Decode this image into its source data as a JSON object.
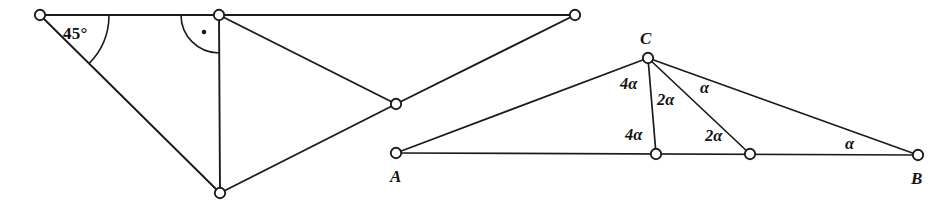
{
  "figure": {
    "canvas": {
      "width": 939,
      "height": 203,
      "background": "#ffffff"
    },
    "stroke_color": "#1b1b1b",
    "node_fill": "#ffffff"
  },
  "left_figure": {
    "name": "right-angle-construction",
    "vertices": [
      {
        "id": "L1",
        "name": "top-left-vertex",
        "x": 40,
        "y": 15
      },
      {
        "id": "L2",
        "name": "top-middle-vertex",
        "x": 219,
        "y": 15
      },
      {
        "id": "L3",
        "name": "top-right-vertex",
        "x": 575,
        "y": 15
      },
      {
        "id": "L4",
        "name": "crossing-vertex",
        "x": 396,
        "y": 104
      },
      {
        "id": "L5",
        "name": "bottom-vertex",
        "x": 220,
        "y": 193
      }
    ],
    "edges": [
      {
        "name": "top-horizontal-edge",
        "from": "L1",
        "to": "L3"
      },
      {
        "name": "hypotenuse-45-edge",
        "from": "L1",
        "to": "L5"
      },
      {
        "name": "vertical-altitude-edge",
        "from": "L2",
        "to": "L5"
      },
      {
        "name": "diagonal-upper-edge",
        "from": "L2",
        "to": "L4"
      },
      {
        "name": "diagonal-lower-edge",
        "from": "L4",
        "to": "L5"
      },
      {
        "name": "diagonal-to-right-edge",
        "from": "L4",
        "to": "L3"
      }
    ],
    "angle_markers": [
      {
        "name": "angle-45-marker",
        "label": "45°",
        "label_x": 63,
        "label_y": 25,
        "arc_cx": 40,
        "arc_cy": 15,
        "arc_r": 69
      },
      {
        "name": "right-angle-marker",
        "label": "",
        "dot_x": 204,
        "dot_y": 32,
        "arc_cx": 219,
        "arc_cy": 15,
        "arc_r": 38
      }
    ]
  },
  "right_figure": {
    "name": "triangle-abc-with-cevians",
    "vertices": [
      {
        "id": "A",
        "name": "vertex-a",
        "x": 396,
        "y": 153
      },
      {
        "id": "C",
        "name": "vertex-c",
        "x": 648,
        "y": 58
      },
      {
        "id": "D",
        "name": "cevian-foot-d",
        "x": 656,
        "y": 154
      },
      {
        "id": "E",
        "name": "cevian-foot-e",
        "x": 750,
        "y": 154
      },
      {
        "id": "B",
        "name": "vertex-b",
        "x": 918,
        "y": 155
      }
    ],
    "edges": [
      {
        "name": "side-ac-edge",
        "from": "A",
        "to": "C"
      },
      {
        "name": "base-ab-edge",
        "from": "A",
        "to": "B"
      },
      {
        "name": "side-cb-edge",
        "from": "C",
        "to": "B"
      },
      {
        "name": "cevian-cd-edge",
        "from": "C",
        "to": "D"
      },
      {
        "name": "cevian-ce-edge",
        "from": "C",
        "to": "E"
      }
    ],
    "point_labels": [
      {
        "name": "point-label-c",
        "text": "C",
        "x": 640,
        "y": 30
      },
      {
        "name": "point-label-a",
        "text": "A",
        "x": 390,
        "y": 168
      },
      {
        "name": "point-label-b",
        "text": "B",
        "x": 911,
        "y": 170
      }
    ],
    "angle_labels": [
      {
        "name": "angle-label-4alpha-at-c",
        "text": "4α",
        "x": 620,
        "y": 76
      },
      {
        "name": "angle-label-2alpha-at-c",
        "text": "2α",
        "x": 657,
        "y": 92
      },
      {
        "name": "angle-label-alpha-at-c",
        "text": "α",
        "x": 700,
        "y": 80
      },
      {
        "name": "angle-label-4alpha-at-d",
        "text": "4α",
        "x": 625,
        "y": 127
      },
      {
        "name": "angle-label-2alpha-at-e",
        "text": "2α",
        "x": 705,
        "y": 128
      },
      {
        "name": "angle-label-alpha-at-b",
        "text": "α",
        "x": 845,
        "y": 136
      }
    ]
  }
}
